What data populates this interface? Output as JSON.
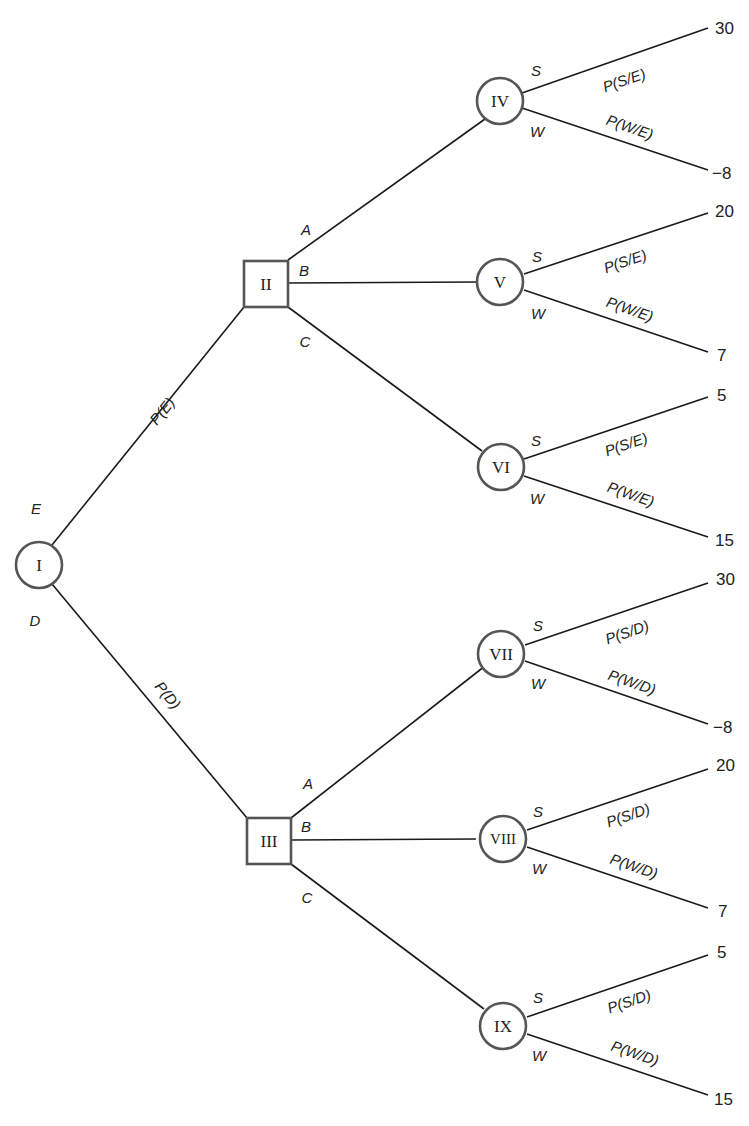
{
  "diagram": {
    "type": "decision-tree",
    "root": {
      "id": "I",
      "kind": "chance",
      "branches": [
        {
          "label": "E",
          "probability": "P(E)",
          "to": "II"
        },
        {
          "label": "D",
          "probability": "P(D)",
          "to": "III"
        }
      ]
    },
    "nodes": [
      {
        "id": "I",
        "kind": "chance",
        "label": "I"
      },
      {
        "id": "II",
        "kind": "decision",
        "label": "II"
      },
      {
        "id": "III",
        "kind": "decision",
        "label": "III"
      },
      {
        "id": "IV",
        "kind": "chance",
        "label": "IV"
      },
      {
        "id": "V",
        "kind": "chance",
        "label": "V"
      },
      {
        "id": "VI",
        "kind": "chance",
        "label": "VI"
      },
      {
        "id": "VII",
        "kind": "chance",
        "label": "VII"
      },
      {
        "id": "VIII",
        "kind": "chance",
        "label": "VIII"
      },
      {
        "id": "IX",
        "kind": "chance",
        "label": "IX"
      }
    ],
    "root_branches": {
      "E": {
        "label": "E",
        "prob": "P(E)"
      },
      "D": {
        "label": "D",
        "prob": "P(D)"
      }
    },
    "decision_branches": {
      "II": {
        "A": "A",
        "B": "B",
        "C": "C"
      },
      "III": {
        "A": "A",
        "B": "B",
        "C": "C"
      }
    },
    "outcomes": {
      "IV": {
        "s_label": "S",
        "w_label": "W",
        "s_prob": "P(S/E)",
        "w_prob": "P(W/E)",
        "s_payoff": "30",
        "w_payoff": "−8"
      },
      "V": {
        "s_label": "S",
        "w_label": "W",
        "s_prob": "P(S/E)",
        "w_prob": "P(W/E)",
        "s_payoff": "20",
        "w_payoff": "7"
      },
      "VI": {
        "s_label": "S",
        "w_label": "W",
        "s_prob": "P(S/E)",
        "w_prob": "P(W/E)",
        "s_payoff": "5",
        "w_payoff": "15"
      },
      "VII": {
        "s_label": "S",
        "w_label": "W",
        "s_prob": "P(S/D)",
        "w_prob": "P(W/D)",
        "s_payoff": "30",
        "w_payoff": "−8"
      },
      "VIII": {
        "s_label": "S",
        "w_label": "W",
        "s_prob": "P(S/D)",
        "w_prob": "P(W/D)",
        "s_payoff": "20",
        "w_payoff": "7"
      },
      "IX": {
        "s_label": "S",
        "w_label": "W",
        "s_prob": "P(S/D)",
        "w_prob": "P(W/D)",
        "s_payoff": "5",
        "w_payoff": "15"
      }
    },
    "colors": {
      "line": "#1a1a1a",
      "node_border": "#555555",
      "background": "#ffffff"
    }
  }
}
